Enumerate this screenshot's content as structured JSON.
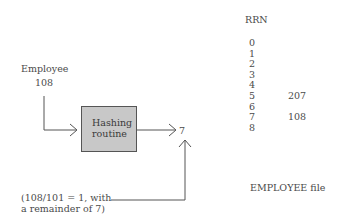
{
  "input": {
    "label": "Employee",
    "key": "108"
  },
  "hashing_box": {
    "line1": "Hashing",
    "line2": "routine"
  },
  "output": {
    "value": "7"
  },
  "note": {
    "line1": "(108/101 = 1, with",
    "line2": "a remainder of 7)"
  },
  "file": {
    "header": "RRN",
    "rows": [
      {
        "rrn": "0",
        "value": ""
      },
      {
        "rrn": "1",
        "value": ""
      },
      {
        "rrn": "2",
        "value": ""
      },
      {
        "rrn": "3",
        "value": ""
      },
      {
        "rrn": "4",
        "value": ""
      },
      {
        "rrn": "5",
        "value": "207"
      },
      {
        "rrn": "6",
        "value": ""
      },
      {
        "rrn": "7",
        "value": "108"
      },
      {
        "rrn": "8",
        "value": ""
      }
    ],
    "caption": "EMPLOYEE file"
  },
  "colors": {
    "box_fill": "#c8c8c8",
    "line": "#555555",
    "text": "#4a4a4a"
  }
}
